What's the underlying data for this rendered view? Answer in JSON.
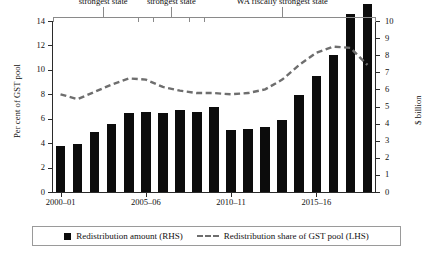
{
  "chart_data": {
    "type": "bar",
    "title": "",
    "subtitle": "",
    "xlabel": "",
    "ylabel": "Per cent of GST pool",
    "y2label": "$ billion",
    "ylim": [
      0,
      14
    ],
    "y2lim": [
      0,
      10
    ],
    "grid": false,
    "legend_position": "bottom",
    "categories": [
      "2000–01",
      "2001–02",
      "2002–03",
      "2003–04",
      "2004–05",
      "2005–06",
      "2006–07",
      "2007–08",
      "2008–09",
      "2009–10",
      "2010–11",
      "2011–12",
      "2012–13",
      "2013–14",
      "2014–15",
      "2015–16",
      "2016–17",
      "2017–18",
      "2018–19"
    ],
    "x_tick_labels": [
      "2000–01",
      "2005–06",
      "2010–11",
      "2015–16"
    ],
    "x_tick_indices": [
      0,
      5,
      10,
      15
    ],
    "y_tick_labels": [
      "0",
      "2",
      "4",
      "6",
      "8",
      "10",
      "12",
      "14"
    ],
    "y_tick_values": [
      0,
      2,
      4,
      6,
      8,
      10,
      12,
      14
    ],
    "y2_tick_labels": [
      "0",
      "1",
      "2",
      "3",
      "4",
      "5",
      "6",
      "7",
      "8",
      "9",
      "10"
    ],
    "y2_tick_values": [
      0,
      1,
      2,
      3,
      4,
      5,
      6,
      7,
      8,
      9,
      10
    ],
    "series": [
      {
        "name": "Redistribution amount (RHS)",
        "type": "bar",
        "axis": "right",
        "unit": "$ billion",
        "color": "#0c0c0c",
        "values": [
          2.7,
          2.8,
          3.5,
          4.0,
          4.6,
          4.7,
          4.6,
          4.8,
          4.7,
          5.0,
          3.6,
          3.7,
          3.8,
          4.2,
          5.7,
          6.8,
          8.0,
          10.4,
          11.0
        ]
      },
      {
        "name": "Redistribution share of GST pool (LHS)",
        "type": "line",
        "axis": "left",
        "unit": "per cent",
        "color": "#6e6e6e",
        "style": "dashed",
        "values": [
          8.0,
          7.6,
          8.2,
          8.8,
          9.3,
          9.2,
          8.6,
          8.3,
          8.1,
          8.1,
          8.0,
          8.1,
          8.4,
          9.2,
          10.4,
          11.4,
          11.9,
          11.8,
          10.4
        ]
      }
    ],
    "annotations": [
      {
        "label": "Victoria fiscally\nstrongest state",
        "start_index": 0,
        "end_index": 5
      },
      {
        "label": "NSW fiscally\nstrongest state",
        "start_index": 5,
        "end_index": 8
      },
      {
        "label": "WA fiscally strongest state",
        "start_index": 8,
        "end_index": 18
      }
    ]
  },
  "axes": {
    "left_title": "Per cent of GST pool",
    "right_title": "$ billion"
  },
  "legend": {
    "items": [
      {
        "icon": "filled-square-marker",
        "label": "Redistribution amount (RHS)"
      },
      {
        "icon": "dashed-line-marker",
        "label": "Redistribution share of GST pool (LHS)"
      }
    ]
  },
  "colors": {
    "bar": "#0c0c0c",
    "line": "#6e6e6e",
    "axis": "#2b2b2b",
    "bracket": "#8a8a8a",
    "background": "#ffffff"
  }
}
